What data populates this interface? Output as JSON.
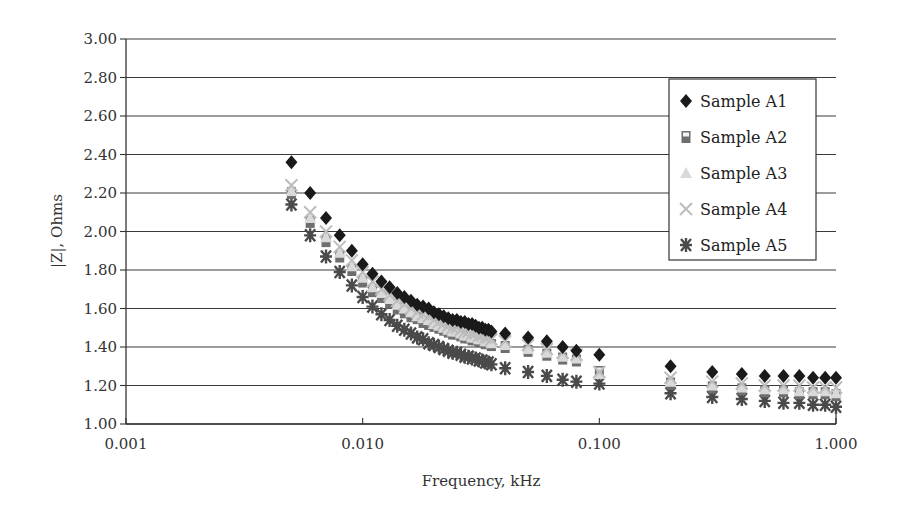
{
  "chart_data": {
    "type": "scatter",
    "title": "",
    "xlabel": "Frequency, kHz",
    "ylabel": "|Z|, Ohms",
    "xscale": "log",
    "xlim": [
      0.001,
      1.0
    ],
    "ylim": [
      1.0,
      3.0
    ],
    "x_ticks": [
      0.001,
      0.01,
      0.1,
      1.0
    ],
    "x_tick_labels": [
      "0.001",
      "0.010",
      "0.100",
      "1.000"
    ],
    "y_ticks": [
      1.0,
      1.2,
      1.4,
      1.6,
      1.8,
      2.0,
      2.2,
      2.4,
      2.6,
      2.8,
      3.0
    ],
    "y_tick_labels": [
      "1.00",
      "1.20",
      "1.40",
      "1.60",
      "1.80",
      "2.00",
      "2.20",
      "2.40",
      "2.60",
      "2.80",
      "3.00"
    ],
    "grid": "horizontal",
    "legend_position": "top-right",
    "x": [
      0.005,
      0.006,
      0.007,
      0.008,
      0.009,
      0.01,
      0.011,
      0.012,
      0.013,
      0.014,
      0.015,
      0.016,
      0.017,
      0.018,
      0.019,
      0.02,
      0.021,
      0.022,
      0.023,
      0.024,
      0.025,
      0.026,
      0.027,
      0.028,
      0.029,
      0.03,
      0.031,
      0.032,
      0.033,
      0.034,
      0.035,
      0.04,
      0.05,
      0.06,
      0.07,
      0.08,
      0.1,
      0.2,
      0.3,
      0.4,
      0.5,
      0.6,
      0.7,
      0.8,
      0.9,
      1.0
    ],
    "series": [
      {
        "name": "Sample A1",
        "marker": "diamond",
        "color": "#1a1a1a",
        "values": [
          2.36,
          2.2,
          2.07,
          1.98,
          1.9,
          1.83,
          1.78,
          1.74,
          1.71,
          1.68,
          1.66,
          1.64,
          1.62,
          1.61,
          1.6,
          1.58,
          1.57,
          1.56,
          1.55,
          1.54,
          1.54,
          1.53,
          1.53,
          1.52,
          1.52,
          1.51,
          1.5,
          1.5,
          1.49,
          1.49,
          1.48,
          1.47,
          1.45,
          1.43,
          1.4,
          1.38,
          1.36,
          1.3,
          1.27,
          1.26,
          1.25,
          1.25,
          1.25,
          1.24,
          1.24,
          1.24
        ]
      },
      {
        "name": "Sample A2",
        "marker": "square",
        "color": "#6e6e6e",
        "values": [
          2.2,
          2.05,
          1.95,
          1.87,
          1.8,
          1.74,
          1.69,
          1.66,
          1.63,
          1.6,
          1.58,
          1.56,
          1.55,
          1.53,
          1.52,
          1.51,
          1.5,
          1.49,
          1.48,
          1.47,
          1.47,
          1.46,
          1.45,
          1.45,
          1.44,
          1.44,
          1.43,
          1.43,
          1.42,
          1.42,
          1.41,
          1.4,
          1.38,
          1.36,
          1.34,
          1.33,
          1.27,
          1.21,
          1.19,
          1.18,
          1.17,
          1.17,
          1.16,
          1.16,
          1.16,
          1.15
        ]
      },
      {
        "name": "Sample A3",
        "marker": "triangle",
        "color": "#d9d9d9",
        "values": [
          2.21,
          2.07,
          1.97,
          1.89,
          1.82,
          1.76,
          1.71,
          1.68,
          1.65,
          1.62,
          1.6,
          1.58,
          1.56,
          1.55,
          1.54,
          1.52,
          1.51,
          1.5,
          1.49,
          1.48,
          1.48,
          1.47,
          1.46,
          1.46,
          1.45,
          1.45,
          1.44,
          1.44,
          1.43,
          1.43,
          1.42,
          1.41,
          1.39,
          1.37,
          1.35,
          1.34,
          1.26,
          1.22,
          1.2,
          1.19,
          1.18,
          1.18,
          1.17,
          1.17,
          1.17,
          1.16
        ]
      },
      {
        "name": "Sample A4",
        "marker": "x",
        "color": "#bdbdbd",
        "values": [
          2.24,
          2.1,
          2.0,
          1.92,
          1.85,
          1.79,
          1.74,
          1.7,
          1.67,
          1.64,
          1.62,
          1.6,
          1.58,
          1.57,
          1.56,
          1.54,
          1.53,
          1.52,
          1.51,
          1.5,
          1.5,
          1.49,
          1.48,
          1.48,
          1.47,
          1.47,
          1.46,
          1.46,
          1.45,
          1.45,
          1.44,
          1.43,
          1.41,
          1.39,
          1.37,
          1.36,
          1.27,
          1.24,
          1.22,
          1.21,
          1.2,
          1.2,
          1.2,
          1.19,
          1.19,
          1.19
        ]
      },
      {
        "name": "Sample A5",
        "marker": "asterisk",
        "color": "#4a4a4a",
        "values": [
          2.14,
          1.98,
          1.87,
          1.79,
          1.72,
          1.66,
          1.61,
          1.57,
          1.54,
          1.51,
          1.49,
          1.47,
          1.45,
          1.44,
          1.42,
          1.41,
          1.4,
          1.39,
          1.38,
          1.37,
          1.37,
          1.36,
          1.35,
          1.35,
          1.34,
          1.34,
          1.33,
          1.33,
          1.32,
          1.32,
          1.31,
          1.29,
          1.27,
          1.25,
          1.23,
          1.22,
          1.21,
          1.16,
          1.14,
          1.13,
          1.12,
          1.11,
          1.11,
          1.1,
          1.1,
          1.09
        ]
      }
    ]
  }
}
